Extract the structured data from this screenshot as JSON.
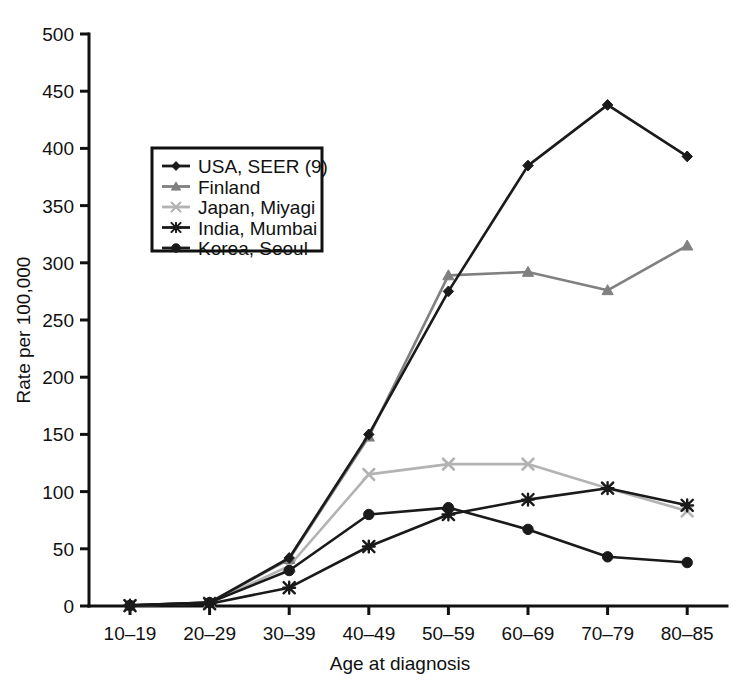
{
  "chart_data": {
    "type": "line",
    "title": "",
    "xlabel": "Age at diagnosis",
    "ylabel": "Rate per 100,000",
    "categories": [
      "10–19",
      "20–29",
      "30–39",
      "40–49",
      "50–59",
      "60–69",
      "70–79",
      "80–85"
    ],
    "ylim": [
      0,
      500
    ],
    "yticks": [
      0,
      50,
      100,
      150,
      200,
      250,
      300,
      350,
      400,
      450,
      500
    ],
    "ytick_labels": [
      "0",
      "50",
      "100",
      "150",
      "200",
      "250",
      "300",
      "350",
      "400",
      "450",
      "500"
    ],
    "grid": false,
    "legend_position": "upper-left-inside",
    "series": [
      {
        "name": "USA, SEER (9)",
        "marker": "diamond",
        "color": "#1a1a1a",
        "values": [
          0.5,
          3,
          42,
          150,
          275,
          385,
          438,
          393
        ]
      },
      {
        "name": "Finland",
        "marker": "triangle",
        "color": "#808080",
        "values": [
          0.4,
          3,
          41,
          148,
          289,
          292,
          276,
          315
        ]
      },
      {
        "name": "Japan, Miyagi",
        "marker": "x",
        "color": "#b3b3b3",
        "values": [
          0.3,
          2.5,
          35,
          115,
          124,
          124,
          103,
          83
        ]
      },
      {
        "name": "India, Mumbai",
        "marker": "star",
        "color": "#1a1a1a",
        "values": [
          0.3,
          2,
          16,
          52,
          80,
          93,
          103,
          88
        ]
      },
      {
        "name": "Korea, Seoul",
        "marker": "circle",
        "color": "#1a1a1a",
        "values": [
          0.5,
          3,
          31,
          80,
          86,
          67,
          43,
          38
        ]
      }
    ]
  },
  "legend": {
    "entries": [
      {
        "label": "USA, SEER (9)"
      },
      {
        "label": "Finland"
      },
      {
        "label": "Japan, Miyagi"
      },
      {
        "label": "India, Miyagi"
      },
      {
        "label": "Korea, Seoul"
      }
    ]
  }
}
